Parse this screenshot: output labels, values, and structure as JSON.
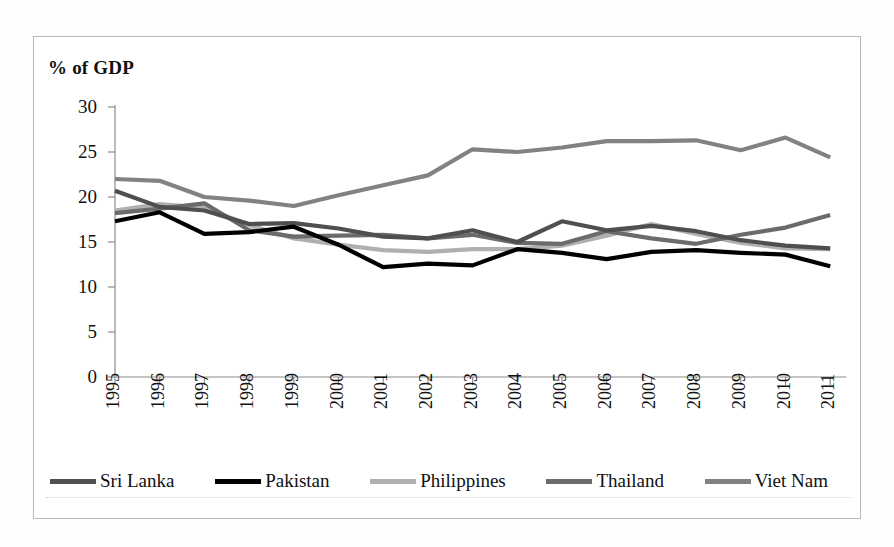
{
  "figure": {
    "axis_title": "% of GDP",
    "background": "#ffffff",
    "frame_color": "#b9b9b9"
  },
  "chart_data": {
    "type": "line",
    "title": "",
    "xlabel": "",
    "ylabel": "% of GDP",
    "ylim": [
      0,
      30
    ],
    "ytick_step": 5,
    "yticks": [
      "30",
      "25",
      "20",
      "15",
      "10",
      "5",
      "0"
    ],
    "grid": false,
    "legend_position": "bottom",
    "categories": [
      "1995",
      "1996",
      "1997",
      "1998",
      "1999",
      "2000",
      "2001",
      "2002",
      "2003",
      "2004",
      "2005",
      "2006",
      "2007",
      "2008",
      "2009",
      "2010",
      "2011"
    ],
    "series": [
      {
        "name": "Sri Lanka",
        "color": "#4f4f4f",
        "values": [
          20.7,
          18.9,
          18.5,
          17.0,
          17.1,
          16.5,
          15.6,
          15.4,
          16.3,
          15.0,
          17.3,
          16.3,
          16.8,
          16.2,
          15.2,
          14.6,
          14.3
        ]
      },
      {
        "name": "Pakistan",
        "color": "#000000",
        "values": [
          17.3,
          18.3,
          15.9,
          16.1,
          16.7,
          14.7,
          12.2,
          12.6,
          12.4,
          14.2,
          13.8,
          13.1,
          13.9,
          14.1,
          13.8,
          13.6,
          12.3
        ]
      },
      {
        "name": "Philippines",
        "color": "#b0b0b0",
        "values": [
          18.5,
          19.2,
          18.8,
          16.9,
          15.4,
          14.7,
          14.1,
          13.9,
          14.2,
          14.2,
          14.6,
          15.7,
          17.0,
          15.9,
          14.9,
          14.3,
          14.2
        ]
      },
      {
        "name": "Thailand",
        "color": "#6b6b6b",
        "values": [
          18.2,
          18.7,
          19.3,
          16.3,
          15.6,
          15.7,
          15.8,
          15.4,
          15.8,
          14.9,
          14.8,
          16.2,
          15.4,
          14.8,
          15.8,
          16.6,
          18.0
        ]
      },
      {
        "name": "Viet Nam",
        "color": "#828282",
        "values": [
          22.0,
          21.8,
          20.0,
          19.6,
          19.0,
          20.2,
          21.3,
          22.4,
          25.3,
          25.0,
          25.5,
          26.2,
          26.2,
          26.3,
          25.2,
          26.6,
          24.4
        ]
      }
    ]
  }
}
